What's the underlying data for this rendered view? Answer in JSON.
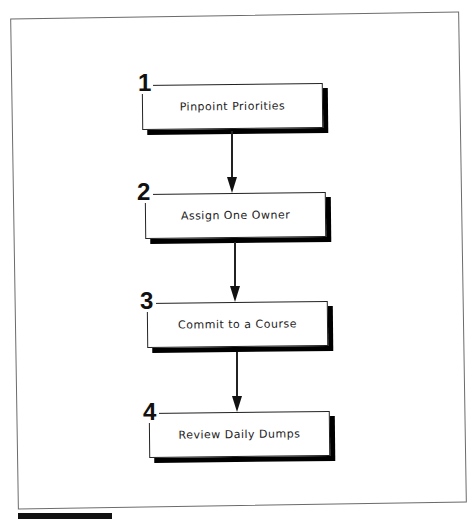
{
  "diagram": {
    "type": "flowchart",
    "direction": "top-to-bottom",
    "steps": [
      {
        "number": "1",
        "label": "Pinpoint Priorities"
      },
      {
        "number": "2",
        "label": "Assign One Owner"
      },
      {
        "number": "3",
        "label": "Commit to a Course"
      },
      {
        "number": "4",
        "label": "Review Daily Dumps"
      }
    ],
    "connectors": [
      {
        "from": "1",
        "to": "2"
      },
      {
        "from": "2",
        "to": "3"
      },
      {
        "from": "3",
        "to": "4"
      }
    ]
  },
  "colors": {
    "box_border": "#222222",
    "box_shadow": "#000000",
    "frame_border": "#6b6b6b",
    "background": "#ffffff"
  }
}
